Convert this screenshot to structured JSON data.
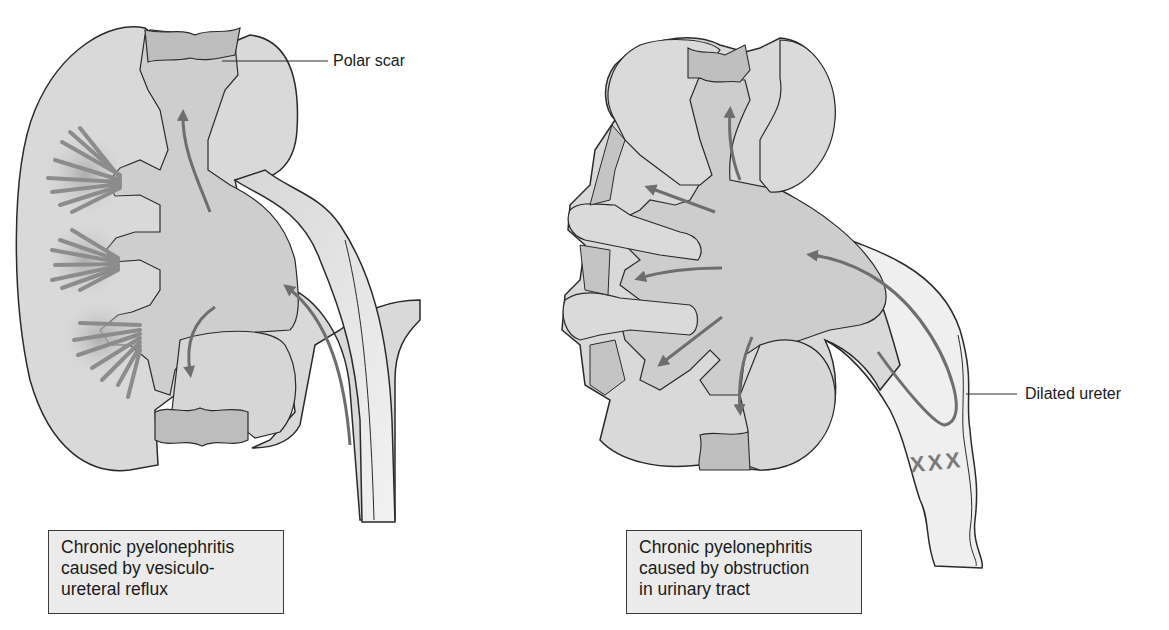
{
  "figure": {
    "left_panel": {
      "label": "Polar scar",
      "caption": [
        "Chronic pyelonephritis",
        "caused by vesiculo-",
        "ureteral reflux"
      ]
    },
    "right_panel": {
      "label": "Dilated ureter",
      "obstruction_marker": "XXX",
      "caption": [
        "Chronic pyelonephritis",
        "caused by obstruction",
        "in urinary tract"
      ]
    }
  },
  "colors": {
    "cortex": "#d9d9d9",
    "pelvis": "#cfcfcf",
    "scar": "#bdbdbd",
    "arrow": "#6e6e6e",
    "outline": "#2a2a2a",
    "caption_bg": "#ebebeb"
  }
}
